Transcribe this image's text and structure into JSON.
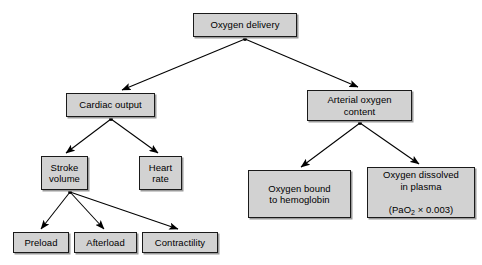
{
  "diagram": {
    "style": {
      "node_fill": "#d2d2d2",
      "node_border": "#1a1a1a",
      "node_shadow": "#9a9a9a",
      "edge_color": "#000000",
      "background": "#ffffff",
      "text_color": "#000000"
    },
    "nodes": [
      {
        "id": "oxygen-delivery",
        "label": "Oxygen delivery",
        "level": 0
      },
      {
        "id": "cardiac-output",
        "label": "Cardiac output",
        "level": 1
      },
      {
        "id": "arterial-oxygen-content",
        "label": "Arterial oxygen\ncontent",
        "level": 1
      },
      {
        "id": "stroke-volume",
        "label": "Stroke\nvolume",
        "level": 2
      },
      {
        "id": "heart-rate",
        "label": "Heart\nrate",
        "level": 2
      },
      {
        "id": "oxygen-bound-hemoglobin",
        "label": "Oxygen bound\nto hemoglobin",
        "level": 2
      },
      {
        "id": "oxygen-dissolved-plasma",
        "label": "Oxygen dissolved\nin plasma",
        "formula_prefix": "(PaO",
        "formula_subscript": "2",
        "formula_suffix": " × 0.003)",
        "level": 2
      },
      {
        "id": "preload",
        "label": "Preload",
        "level": 3
      },
      {
        "id": "afterload",
        "label": "Afterload",
        "level": 3
      },
      {
        "id": "contractility",
        "label": "Contractility",
        "level": 3
      }
    ],
    "edges": [
      {
        "from": "oxygen-delivery",
        "to": "cardiac-output"
      },
      {
        "from": "oxygen-delivery",
        "to": "arterial-oxygen-content"
      },
      {
        "from": "cardiac-output",
        "to": "stroke-volume"
      },
      {
        "from": "cardiac-output",
        "to": "heart-rate"
      },
      {
        "from": "arterial-oxygen-content",
        "to": "oxygen-bound-hemoglobin"
      },
      {
        "from": "arterial-oxygen-content",
        "to": "oxygen-dissolved-plasma"
      },
      {
        "from": "stroke-volume",
        "to": "preload"
      },
      {
        "from": "stroke-volume",
        "to": "afterload"
      },
      {
        "from": "stroke-volume",
        "to": "contractility"
      }
    ]
  }
}
